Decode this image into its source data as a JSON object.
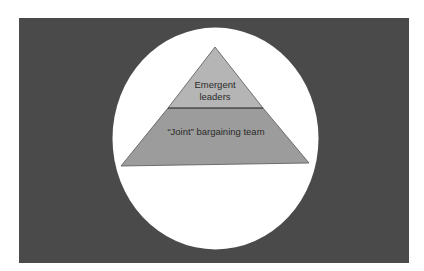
{
  "diagram": {
    "type": "pyramid",
    "levels": [
      {
        "label_line1": "Emergent",
        "label_line2": "leaders",
        "fill": "#b5b5b5"
      },
      {
        "label": "“Joint” bargaining team",
        "fill": "#9c9c9c"
      }
    ],
    "background_color": "#4a4a4a",
    "circle_color": "#ffffff"
  }
}
